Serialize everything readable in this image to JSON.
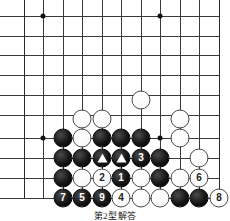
{
  "figure": {
    "kind": "go-board-diagram",
    "caption": "第2型解答",
    "board": {
      "columns": [
        24,
        43,
        63,
        82,
        102,
        121,
        141,
        160,
        180,
        199,
        219
      ],
      "rows": [
        16,
        36,
        55,
        75,
        95,
        115,
        138,
        158,
        178,
        198
      ],
      "line_color": "#3a3a3a",
      "edge_color": "#2a2a2a",
      "background": "#ffffff"
    },
    "star_points": [
      {
        "name": "star-point-left",
        "cx": 43,
        "cy": 16
      },
      {
        "name": "star-point-right",
        "cx": 160,
        "cy": 16
      },
      {
        "name": "star-point-lower-left",
        "cx": 43,
        "cy": 138
      },
      {
        "name": "star-point-lower-right",
        "cx": 160,
        "cy": 138
      }
    ],
    "stones": [
      {
        "color": "white",
        "cx": 141,
        "cy": 100,
        "label": "",
        "marker": ""
      },
      {
        "color": "white",
        "cx": 82,
        "cy": 119,
        "label": "",
        "marker": ""
      },
      {
        "color": "white",
        "cx": 102,
        "cy": 119,
        "label": "",
        "marker": ""
      },
      {
        "color": "white",
        "cx": 180,
        "cy": 119,
        "label": "",
        "marker": ""
      },
      {
        "color": "black",
        "cx": 63,
        "cy": 138,
        "label": "",
        "marker": ""
      },
      {
        "color": "white",
        "cx": 82,
        "cy": 138,
        "label": "",
        "marker": ""
      },
      {
        "color": "black",
        "cx": 102,
        "cy": 138,
        "label": "",
        "marker": ""
      },
      {
        "color": "black",
        "cx": 121,
        "cy": 138,
        "label": "",
        "marker": ""
      },
      {
        "color": "black",
        "cx": 141,
        "cy": 138,
        "label": "",
        "marker": ""
      },
      {
        "color": "white",
        "cx": 180,
        "cy": 138,
        "label": "",
        "marker": ""
      },
      {
        "color": "black",
        "cx": 63,
        "cy": 158,
        "label": "",
        "marker": ""
      },
      {
        "color": "black",
        "cx": 82,
        "cy": 158,
        "label": "",
        "marker": ""
      },
      {
        "color": "black",
        "cx": 102,
        "cy": 158,
        "label": "",
        "marker": "triangle"
      },
      {
        "color": "black",
        "cx": 121,
        "cy": 158,
        "label": "",
        "marker": "triangle"
      },
      {
        "color": "black",
        "cx": 141,
        "cy": 158,
        "label": "3",
        "marker": ""
      },
      {
        "color": "black",
        "cx": 160,
        "cy": 158,
        "label": "",
        "marker": ""
      },
      {
        "color": "white",
        "cx": 199,
        "cy": 158,
        "label": "",
        "marker": ""
      },
      {
        "color": "black",
        "cx": 63,
        "cy": 178,
        "label": "",
        "marker": ""
      },
      {
        "color": "white",
        "cx": 82,
        "cy": 178,
        "label": "",
        "marker": ""
      },
      {
        "color": "white",
        "cx": 102,
        "cy": 178,
        "label": "2",
        "marker": ""
      },
      {
        "color": "black",
        "cx": 121,
        "cy": 178,
        "label": "1",
        "marker": ""
      },
      {
        "color": "white",
        "cx": 141,
        "cy": 178,
        "label": "",
        "marker": ""
      },
      {
        "color": "black",
        "cx": 160,
        "cy": 178,
        "label": "",
        "marker": ""
      },
      {
        "color": "white",
        "cx": 180,
        "cy": 178,
        "label": "",
        "marker": ""
      },
      {
        "color": "white",
        "cx": 199,
        "cy": 178,
        "label": "6",
        "marker": ""
      },
      {
        "color": "black",
        "cx": 63,
        "cy": 198,
        "label": "7",
        "marker": ""
      },
      {
        "color": "black",
        "cx": 82,
        "cy": 198,
        "label": "5",
        "marker": ""
      },
      {
        "color": "black",
        "cx": 102,
        "cy": 198,
        "label": "9",
        "marker": ""
      },
      {
        "color": "white",
        "cx": 121,
        "cy": 198,
        "label": "4",
        "marker": ""
      },
      {
        "color": "white",
        "cx": 141,
        "cy": 198,
        "label": "",
        "marker": ""
      },
      {
        "color": "white",
        "cx": 160,
        "cy": 198,
        "label": "",
        "marker": ""
      },
      {
        "color": "black",
        "cx": 180,
        "cy": 198,
        "label": "",
        "marker": ""
      },
      {
        "color": "black",
        "cx": 199,
        "cy": 198,
        "label": "",
        "marker": ""
      },
      {
        "color": "white",
        "cx": 219,
        "cy": 198,
        "label": "8",
        "marker": ""
      }
    ]
  }
}
